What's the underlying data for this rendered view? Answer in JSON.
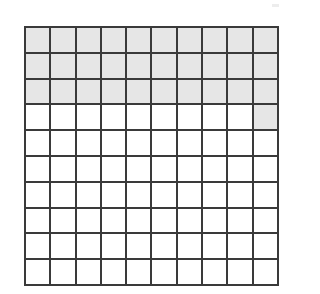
{
  "figure": {
    "name": "hundredths-grid",
    "kind": "10x10 square grid model",
    "rows": 10,
    "columns": 10,
    "total_cells": 100,
    "shaded_cells": 31,
    "unshaded_cells": 69,
    "fraction_shaded": "31/100",
    "decimal_shaded": "0.31",
    "percent_shaded": "31%"
  },
  "colors": {
    "shaded_fill": "#e6e6e6",
    "unshaded_fill": "#ffffff",
    "grid_line": "#3a3a3a",
    "page_background": "#ffffff"
  },
  "chart_data": {
    "type": "heatmap",
    "title": "",
    "xlabel": "",
    "ylabel": "",
    "rows": 10,
    "columns": 10,
    "legend": [
      {
        "key": "shaded",
        "value": 1,
        "label": "Shaded",
        "color": "#e6e6e6"
      },
      {
        "key": "unshaded",
        "value": 0,
        "label": "Unshaded",
        "color": "#ffffff"
      }
    ],
    "cells": [
      [
        1,
        1,
        1,
        1,
        1,
        1,
        1,
        1,
        1,
        1
      ],
      [
        1,
        1,
        1,
        1,
        1,
        1,
        1,
        1,
        1,
        1
      ],
      [
        1,
        1,
        1,
        1,
        1,
        1,
        1,
        1,
        1,
        1
      ],
      [
        0,
        0,
        0,
        0,
        0,
        0,
        0,
        0,
        0,
        1
      ],
      [
        0,
        0,
        0,
        0,
        0,
        0,
        0,
        0,
        0,
        0
      ],
      [
        0,
        0,
        0,
        0,
        0,
        0,
        0,
        0,
        0,
        0
      ],
      [
        0,
        0,
        0,
        0,
        0,
        0,
        0,
        0,
        0,
        0
      ],
      [
        0,
        0,
        0,
        0,
        0,
        0,
        0,
        0,
        0,
        0
      ],
      [
        0,
        0,
        0,
        0,
        0,
        0,
        0,
        0,
        0,
        0
      ],
      [
        0,
        0,
        0,
        0,
        0,
        0,
        0,
        0,
        0,
        0
      ]
    ],
    "row_shaded_counts": [
      10,
      10,
      10,
      1,
      0,
      0,
      0,
      0,
      0,
      0
    ],
    "column_shaded_counts": [
      3,
      3,
      3,
      3,
      3,
      3,
      3,
      3,
      3,
      4
    ]
  }
}
